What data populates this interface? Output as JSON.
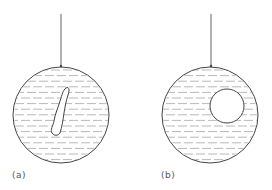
{
  "figure": {
    "panels": [
      {
        "id": "a",
        "label": "(a)",
        "label_pos": {
          "x": 12,
          "y": 170
        },
        "string": {
          "x": 61,
          "y1": 14,
          "y2": 66
        },
        "sphere": {
          "cx": 61,
          "cy": 115,
          "r": 48
        },
        "inclusion": {
          "shape": "irregular-elongated-blob",
          "path": "M66 88 C69 86, 70 90, 68 95 C66 101, 65 107, 64 113 C63 120, 62 127, 60 133 C58 136, 54 136, 52 133 C50 130, 53 126, 54 121 C55 114, 58 108, 60 101 C62 95, 63 90, 66 88 Z"
        }
      },
      {
        "id": "b",
        "label": "(b)",
        "label_pos": {
          "x": 161,
          "y": 170
        },
        "string": {
          "x": 211,
          "y1": 14,
          "y2": 66
        },
        "sphere": {
          "cx": 210,
          "cy": 115,
          "r": 48
        },
        "inclusion": {
          "shape": "circle",
          "cx": 227,
          "cy": 106,
          "r": 17
        }
      }
    ],
    "colors": {
      "outline": "#444444",
      "string": "#666666",
      "hatch": "#b0b0b0",
      "background": "#ffffff"
    },
    "hatch": {
      "spacing": 5.6,
      "dash": 9,
      "gap": 3
    }
  }
}
